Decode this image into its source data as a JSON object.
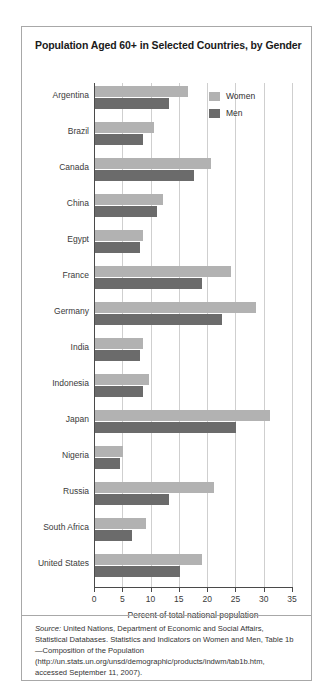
{
  "chart_data": {
    "type": "bar",
    "orientation": "horizontal",
    "title": "Population Aged 60+ in Selected Countries, by Gender",
    "xlabel": "Percent of total national population",
    "ylabel": "",
    "xlim": [
      0,
      35
    ],
    "xticks": [
      0,
      5,
      10,
      15,
      20,
      25,
      30,
      35
    ],
    "grid": "vertical",
    "legend_position": "upper-right-inside",
    "categories": [
      "Argentina",
      "Brazil",
      "Canada",
      "China",
      "Egypt",
      "France",
      "Germany",
      "India",
      "Indonesia",
      "Japan",
      "Nigeria",
      "Russia",
      "South Africa",
      "United States"
    ],
    "series": [
      {
        "name": "Women",
        "color": "#b2b2b2",
        "values": [
          16.5,
          10.5,
          20.5,
          12.0,
          8.5,
          24.0,
          28.5,
          8.5,
          9.5,
          31.0,
          5.0,
          21.0,
          9.0,
          19.0
        ]
      },
      {
        "name": "Men",
        "color": "#6b6b6b",
        "values": [
          13.0,
          8.5,
          17.5,
          11.0,
          8.0,
          19.0,
          22.5,
          8.0,
          8.5,
          25.0,
          4.5,
          13.0,
          6.5,
          15.0
        ]
      }
    ]
  },
  "source": {
    "label": "Source:",
    "text": " United Nations, Department of Economic and Social Affairs, Statistical Databases. Statistics and Indicators on Women and Men, Table 1b—Composition of the Population (http://un.stats.un.org/unsd/demographic/products/indwm/tab1b.htm, accessed September 11, 2007)."
  }
}
